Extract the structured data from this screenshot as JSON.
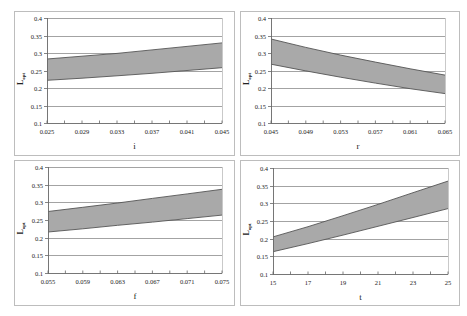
{
  "colors": {
    "band_fill": "#a9a9a9",
    "band_edge": "#555555",
    "grid": "#8c8c8c",
    "frame": "#bdbdbd",
    "axis": "#666666"
  },
  "chart_data": [
    {
      "type": "area",
      "title": "",
      "xlabel": "i",
      "ylabel": "Lopt",
      "ylabel_main": "L",
      "ylabel_sub": "opt",
      "ylim": [
        0.1,
        0.4
      ],
      "yticks": [
        "0.1",
        "0.15",
        "0.2",
        "0.25",
        "0.3",
        "0.35",
        "0.4"
      ],
      "xlim": [
        0.025,
        0.045
      ],
      "xticks": [
        "0.025",
        "0.029",
        "0.033",
        "0.037",
        "0.041",
        "0.045"
      ],
      "grid": true,
      "x": [
        0.025,
        0.029,
        0.033,
        0.037,
        0.041,
        0.045
      ],
      "series": [
        {
          "name": "upper",
          "values": [
            0.283,
            0.291,
            0.299,
            0.309,
            0.319,
            0.329
          ]
        },
        {
          "name": "lower",
          "values": [
            0.222,
            0.228,
            0.235,
            0.242,
            0.25,
            0.258
          ]
        }
      ]
    },
    {
      "type": "area",
      "title": "",
      "xlabel": "r",
      "ylabel": "Lopt",
      "ylabel_main": "L",
      "ylabel_sub": "opt",
      "ylim": [
        0.1,
        0.4
      ],
      "yticks": [
        "0.1",
        "0.15",
        "0.2",
        "0.25",
        "0.3",
        "0.35",
        "0.4"
      ],
      "xlim": [
        0.045,
        0.065
      ],
      "xticks": [
        "0.045",
        "0.049",
        "0.053",
        "0.057",
        "0.061",
        "0.065"
      ],
      "grid": true,
      "x": [
        0.045,
        0.049,
        0.053,
        0.057,
        0.061,
        0.065
      ],
      "series": [
        {
          "name": "upper",
          "values": [
            0.34,
            0.316,
            0.294,
            0.274,
            0.255,
            0.237
          ]
        },
        {
          "name": "lower",
          "values": [
            0.268,
            0.249,
            0.231,
            0.214,
            0.198,
            0.184
          ]
        }
      ]
    },
    {
      "type": "area",
      "title": "",
      "xlabel": "f",
      "ylabel": "Lopt",
      "ylabel_main": "L",
      "ylabel_sub": "opt",
      "ylim": [
        0.1,
        0.4
      ],
      "yticks": [
        "0.1",
        "0.15",
        "0.2",
        "0.25",
        "0.3",
        "0.35",
        "0.4"
      ],
      "xlim": [
        0.055,
        0.075
      ],
      "xticks": [
        "0.055",
        "0.059",
        "0.063",
        "0.067",
        "0.071",
        "0.075"
      ],
      "grid": true,
      "x": [
        0.055,
        0.059,
        0.063,
        0.067,
        0.071,
        0.075
      ],
      "series": [
        {
          "name": "upper",
          "values": [
            0.274,
            0.286,
            0.298,
            0.311,
            0.324,
            0.337
          ]
        },
        {
          "name": "lower",
          "values": [
            0.216,
            0.225,
            0.235,
            0.244,
            0.254,
            0.264
          ]
        }
      ]
    },
    {
      "type": "area",
      "title": "",
      "xlabel": "t",
      "ylabel": "Lopt",
      "ylabel_main": "L",
      "ylabel_sub": "opt",
      "ylim": [
        0.1,
        0.4
      ],
      "yticks": [
        "0.1",
        "0.15",
        "0.2",
        "0.25",
        "0.3",
        "0.35",
        "0.4"
      ],
      "xlim": [
        15,
        25
      ],
      "xticks": [
        "15",
        "17",
        "19",
        "21",
        "23",
        "25"
      ],
      "grid": true,
      "x": [
        15,
        17,
        19,
        21,
        23,
        25
      ],
      "series": [
        {
          "name": "upper",
          "values": [
            0.205,
            0.234,
            0.265,
            0.297,
            0.33,
            0.363
          ]
        },
        {
          "name": "lower",
          "values": [
            0.163,
            0.186,
            0.21,
            0.235,
            0.26,
            0.285
          ]
        }
      ]
    }
  ],
  "layout": {
    "panels": [
      {
        "frame": [
          14,
          11,
          220,
          144
        ],
        "plot": [
          47,
          18,
          175,
          105
        ]
      },
      {
        "frame": [
          240,
          11,
          219,
          144
        ],
        "plot": [
          271,
          18,
          174,
          105
        ]
      },
      {
        "frame": [
          14,
          160,
          220,
          145
        ],
        "plot": [
          48,
          167,
          174,
          106
        ]
      },
      {
        "frame": [
          240,
          160,
          219,
          145
        ],
        "plot": [
          273,
          168,
          175,
          106
        ]
      }
    ]
  }
}
